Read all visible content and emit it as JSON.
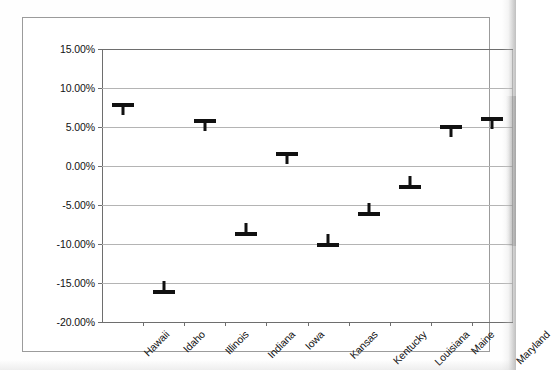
{
  "chart_data": {
    "type": "scatter",
    "title": "",
    "subtitle": "",
    "xlabel": "",
    "ylabel": "",
    "categories": [
      "Hawaii",
      "Idaho",
      "Illinois",
      "Indiana",
      "Iowa",
      "Kansas",
      "Kentucky",
      "Louisiana",
      "Maine",
      "Maryland"
    ],
    "values": [
      7.9,
      -16.0,
      5.9,
      -8.6,
      1.7,
      -10.0,
      -6.0,
      -2.6,
      5.1,
      6.2
    ],
    "value_labels": [
      "7.90%",
      "-16.00%",
      "5.90%",
      "-8.60%",
      "1.70%",
      "-10.00%",
      "-6.00%",
      "-2.60%",
      "5.10%",
      "6.20%"
    ],
    "ylim": [
      -20,
      15
    ],
    "ytick_values": [
      15,
      10,
      5,
      0,
      -5,
      -10,
      -15,
      -20
    ],
    "ytick_labels": [
      "15.00%",
      "10.00%",
      "5.00%",
      "0.00%",
      "-5.00%",
      "-10.00%",
      "-15.00%",
      "-20.00%"
    ],
    "grid": true,
    "legend": "none",
    "marker_style": "dash-with-stem",
    "marker_color": "#111111",
    "gridline_color": "#b4b4b4",
    "axis_color": "#6e6e6e",
    "plot_background": "#ffffff",
    "xlabel_rotation": -45
  }
}
